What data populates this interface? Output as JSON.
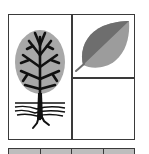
{
  "illustration": {
    "panels": [
      {
        "id": "tree",
        "icon": "tree-with-roots-icon"
      },
      {
        "id": "leaf",
        "icon": "leaf-icon"
      },
      {
        "id": "empty",
        "icon": null
      }
    ],
    "bottom_row_cells": 4,
    "colors": {
      "border": "#3a3a3a",
      "canopy": "#a8a8a8",
      "branches": "#111111",
      "leaf_dark": "#6e6e6e",
      "leaf_light": "#9c9c9c",
      "bottom_fill": "#bdbdbd"
    }
  }
}
